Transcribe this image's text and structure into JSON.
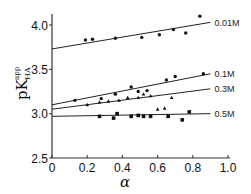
{
  "chart_data": {
    "type": "scatter",
    "title": "",
    "xlabel": "α",
    "ylabel": "pK_HA^app",
    "ylabel_parts": {
      "main": "pK",
      "sup": "app",
      "sub": "HA"
    },
    "xlim": [
      0,
      1.0
    ],
    "ylim": [
      2.5,
      4.1
    ],
    "x_ticks": [
      0,
      0.2,
      0.4,
      0.6,
      0.8,
      1.0
    ],
    "x_tick_labels": [
      "0",
      "0.2",
      "0.4",
      "0.6",
      "0.8",
      "1.0"
    ],
    "y_ticks": [
      2.5,
      3.0,
      3.5,
      4.0
    ],
    "y_tick_labels": [
      "2.5",
      "3.0",
      "3.5",
      "4.0"
    ],
    "grid": false,
    "legend": "inline labels at right end of fit lines",
    "series": [
      {
        "name": "0.01M",
        "label": "0.01M",
        "marker": "dot",
        "fit_line": {
          "x": [
            0,
            0.9
          ],
          "y": [
            3.73,
            4.03
          ]
        },
        "points": [
          {
            "x": 0.19,
            "y": 3.83
          },
          {
            "x": 0.23,
            "y": 3.84
          },
          {
            "x": 0.36,
            "y": 3.85
          },
          {
            "x": 0.51,
            "y": 3.86
          },
          {
            "x": 0.61,
            "y": 3.89
          },
          {
            "x": 0.69,
            "y": 3.95
          },
          {
            "x": 0.76,
            "y": 3.91
          },
          {
            "x": 0.84,
            "y": 4.1
          }
        ]
      },
      {
        "name": "0.1M",
        "label": "0.1M",
        "marker": "dot",
        "fit_line": {
          "x": [
            0,
            0.9
          ],
          "y": [
            3.1,
            3.45
          ]
        },
        "points": [
          {
            "x": 0.13,
            "y": 3.15
          },
          {
            "x": 0.28,
            "y": 3.17
          },
          {
            "x": 0.36,
            "y": 3.22
          },
          {
            "x": 0.45,
            "y": 3.3
          },
          {
            "x": 0.49,
            "y": 3.25
          },
          {
            "x": 0.54,
            "y": 3.26
          },
          {
            "x": 0.65,
            "y": 3.38
          },
          {
            "x": 0.7,
            "y": 3.42
          },
          {
            "x": 0.86,
            "y": 3.45
          }
        ]
      },
      {
        "name": "0.3M",
        "label": "0.3M",
        "marker": "triangle",
        "fit_line": {
          "x": [
            0,
            0.9
          ],
          "y": [
            3.05,
            3.28
          ]
        },
        "points": [
          {
            "x": 0.2,
            "y": 3.1
          },
          {
            "x": 0.27,
            "y": 3.13
          },
          {
            "x": 0.32,
            "y": 3.14
          },
          {
            "x": 0.38,
            "y": 3.15
          },
          {
            "x": 0.43,
            "y": 3.18
          },
          {
            "x": 0.49,
            "y": 3.18
          },
          {
            "x": 0.52,
            "y": 3.22
          },
          {
            "x": 0.56,
            "y": 3.2
          },
          {
            "x": 0.6,
            "y": 3.05
          },
          {
            "x": 0.64,
            "y": 3.06
          },
          {
            "x": 0.68,
            "y": 3.18
          }
        ]
      },
      {
        "name": "0.5M",
        "label": "0.5M",
        "marker": "square",
        "fit_line": {
          "x": [
            0,
            0.9
          ],
          "y": [
            2.97,
            3.0
          ]
        },
        "points": [
          {
            "x": 0.27,
            "y": 2.97
          },
          {
            "x": 0.35,
            "y": 2.95
          },
          {
            "x": 0.37,
            "y": 3.0
          },
          {
            "x": 0.45,
            "y": 2.97
          },
          {
            "x": 0.49,
            "y": 2.98
          },
          {
            "x": 0.52,
            "y": 2.97
          },
          {
            "x": 0.56,
            "y": 2.97
          },
          {
            "x": 0.66,
            "y": 2.97
          },
          {
            "x": 0.74,
            "y": 2.93
          },
          {
            "x": 0.78,
            "y": 3.02
          }
        ]
      }
    ]
  }
}
